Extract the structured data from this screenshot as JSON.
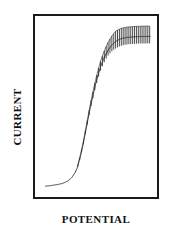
{
  "figure": {
    "background_color": "#ffffff",
    "frame_color": "#1a1a1a",
    "trace_color": "#2b2b2b"
  },
  "labels": {
    "x_axis": "POTENTIAL",
    "y_axis": "CURRENT"
  },
  "chart_data": {
    "type": "line",
    "title": "",
    "subtitle": "",
    "xlabel": "POTENTIAL",
    "ylabel": "CURRENT",
    "xlim": [
      0,
      100
    ],
    "ylim": [
      0,
      100
    ],
    "grid": false,
    "legend_position": "none",
    "axis_ticks": false,
    "tick_labels": {
      "x": [],
      "y": []
    },
    "annotations": [],
    "series": [
      {
        "name": "current response",
        "color": "#2b2b2b",
        "x": [
          8,
          11,
          14,
          17,
          20,
          23,
          26,
          29,
          32,
          34,
          36,
          38,
          40,
          42,
          44,
          46,
          48,
          50,
          52,
          54,
          56,
          58,
          60,
          62,
          64,
          66,
          68,
          70,
          72,
          74,
          76,
          78,
          80,
          82,
          84,
          86,
          88,
          90,
          92
        ],
        "y": [
          8,
          8.2,
          8.5,
          8.8,
          9.2,
          9.8,
          10.8,
          12.5,
          15.5,
          19,
          24,
          30,
          37,
          44,
          51,
          57,
          63,
          68,
          72.5,
          76,
          79,
          81.5,
          83.5,
          85,
          86.2,
          87,
          87.6,
          88,
          88.3,
          88.5,
          88.6,
          88.7,
          88.8,
          88.85,
          88.9,
          88.9,
          88.95,
          88.95,
          89
        ]
      }
    ],
    "noise": {
      "present": true,
      "kind": "vertical-oscillation-spikes",
      "onset_x": 34,
      "end_x": 92,
      "period_x": 1.5,
      "max_amplitude_y": 9,
      "ramp_start_amplitude_y": 1
    }
  }
}
